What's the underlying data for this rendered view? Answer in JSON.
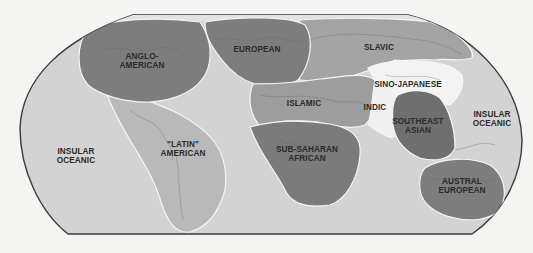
{
  "map": {
    "title": "World Culture Realms",
    "projection": "Robinson-like",
    "colors": {
      "page_background": "#f4f4f3",
      "ocean": "#d3d3d3",
      "frame_border": "#3a3a3a",
      "region_boundary": "#f5f5f5",
      "dark_region": "#7c7c7c",
      "mid_region": "#969696",
      "light_region": "#b7b7b7",
      "white_region": "#f0f0f0",
      "label_text": "#2a2a2a"
    },
    "regions": [
      {
        "id": "anglo-american",
        "label_lines": [
          "ANGLO-",
          "AMERICAN"
        ],
        "shade": "dark"
      },
      {
        "id": "latin-american",
        "label_lines": [
          "\"LATIN\"",
          "AMERICAN"
        ],
        "shade": "light"
      },
      {
        "id": "european",
        "label_lines": [
          "EUROPEAN"
        ],
        "shade": "dark"
      },
      {
        "id": "slavic",
        "label_lines": [
          "SLAVIC"
        ],
        "shade": "mid"
      },
      {
        "id": "islamic",
        "label_lines": [
          "ISLAMIC"
        ],
        "shade": "mid"
      },
      {
        "id": "sub-saharan-african",
        "label_lines": [
          "SUB-SAHARAN",
          "AFRICAN"
        ],
        "shade": "dark"
      },
      {
        "id": "sino-japanese",
        "label_lines": [
          "SINO-JAPANESE"
        ],
        "shade": "white"
      },
      {
        "id": "indic",
        "label_lines": [
          "INDIC"
        ],
        "shade": "white"
      },
      {
        "id": "southeast-asian",
        "label_lines": [
          "SOUTHEAST",
          "ASIAN"
        ],
        "shade": "dark"
      },
      {
        "id": "austral-european",
        "label_lines": [
          "AUSTRAL",
          "EUROPEAN"
        ],
        "shade": "dark"
      },
      {
        "id": "insular-oceanic-west",
        "label_lines": [
          "INSULAR",
          "OCEANIC"
        ],
        "shade": "ocean"
      },
      {
        "id": "insular-oceanic-east",
        "label_lines": [
          "INSULAR",
          "OCEANIC"
        ],
        "shade": "ocean"
      }
    ]
  }
}
